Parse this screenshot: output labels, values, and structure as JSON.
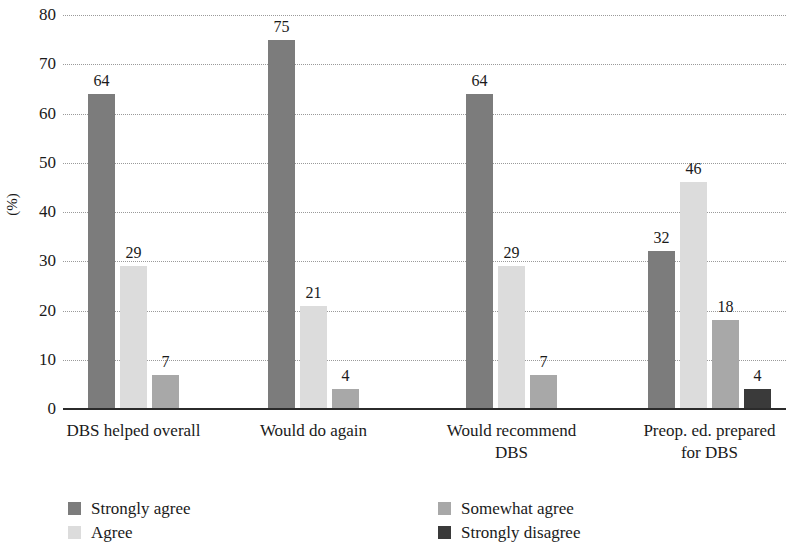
{
  "chart_data": {
    "type": "bar",
    "title": "",
    "subtitle": "",
    "xlabel": "",
    "ylabel": "(%)",
    "ylim": [
      0,
      80
    ],
    "ytick_step": 10,
    "yticks": [
      80,
      70,
      60,
      50,
      40,
      30,
      20,
      10,
      0
    ],
    "grid": true,
    "grid_style": "dotted-horizontal",
    "legend_position": "bottom",
    "categories": [
      "DBS helped overall",
      "Would do again",
      "Would recommend DBS",
      "Preop. ed. prepared for DBS"
    ],
    "category_lines": [
      [
        "DBS helped overall"
      ],
      [
        "Would do again"
      ],
      [
        "Would recommend",
        "DBS"
      ],
      [
        "Preop. ed. prepared",
        "for DBS"
      ]
    ],
    "series": [
      {
        "name": "Strongly agree",
        "color": "#7c7c7c",
        "values": [
          64,
          75,
          64,
          32
        ]
      },
      {
        "name": "Agree",
        "color": "#dcdcdc",
        "values": [
          29,
          21,
          29,
          46
        ]
      },
      {
        "name": "Somewhat agree",
        "color": "#a8a8a8",
        "values": [
          7,
          4,
          7,
          18
        ]
      },
      {
        "name": "Strongly disagree",
        "color": "#3a3a3a",
        "values": [
          null,
          null,
          null,
          4
        ]
      }
    ],
    "bar_labels": [
      [
        64,
        29,
        7
      ],
      [
        75,
        21,
        4
      ],
      [
        64,
        29,
        7
      ],
      [
        32,
        46,
        18,
        4
      ]
    ]
  },
  "axis": {
    "y_title": "(%)",
    "y_ticks": [
      "80",
      "70",
      "60",
      "50",
      "40",
      "30",
      "20",
      "10",
      "0"
    ]
  },
  "categories": [
    {
      "line1": "DBS helped overall",
      "line2": ""
    },
    {
      "line1": "Would do again",
      "line2": ""
    },
    {
      "line1": "Would recommend",
      "line2": "DBS"
    },
    {
      "line1": "Preop. ed. prepared",
      "line2": "for DBS"
    }
  ],
  "bars": [
    {
      "group": 0,
      "series": 0,
      "value": "64"
    },
    {
      "group": 0,
      "series": 1,
      "value": "29"
    },
    {
      "group": 0,
      "series": 2,
      "value": "7"
    },
    {
      "group": 1,
      "series": 0,
      "value": "75"
    },
    {
      "group": 1,
      "series": 1,
      "value": "21"
    },
    {
      "group": 1,
      "series": 2,
      "value": "4"
    },
    {
      "group": 2,
      "series": 0,
      "value": "64"
    },
    {
      "group": 2,
      "series": 1,
      "value": "29"
    },
    {
      "group": 2,
      "series": 2,
      "value": "7"
    },
    {
      "group": 3,
      "series": 0,
      "value": "32"
    },
    {
      "group": 3,
      "series": 1,
      "value": "46"
    },
    {
      "group": 3,
      "series": 2,
      "value": "18"
    },
    {
      "group": 3,
      "series": 3,
      "value": "4"
    }
  ],
  "legend": {
    "items": [
      {
        "label": "Strongly agree",
        "color": "#7c7c7c"
      },
      {
        "label": "Agree",
        "color": "#dcdcdc"
      },
      {
        "label": "Somewhat agree",
        "color": "#a8a8a8"
      },
      {
        "label": "Strongly disagree",
        "color": "#3a3a3a"
      }
    ]
  },
  "colors": {
    "strongly_agree": "#7c7c7c",
    "agree": "#dcdcdc",
    "somewhat_agree": "#a8a8a8",
    "strongly_disagree": "#3a3a3a",
    "axis": "#2b2b2b",
    "grid": "#9a9a9a",
    "text": "#1a1a1a",
    "background": "#ffffff"
  }
}
